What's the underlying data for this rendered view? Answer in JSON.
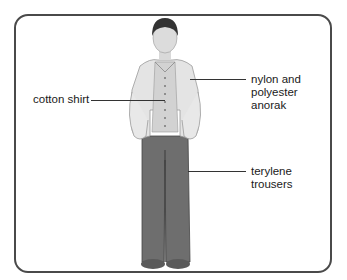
{
  "diagram": {
    "title": "",
    "labels": {
      "shirt": "cotton shirt",
      "anorak_line1": "nylon and",
      "anorak_line2": "polyester",
      "anorak_line3": "anorak",
      "trousers_line1": "terylene",
      "trousers_line2": "trousers"
    },
    "colors": {
      "frame": "#4a4a4a",
      "anorak": "#e2e2e2",
      "shirt": "#cfcfcf",
      "trousers": "#6e6e6e",
      "hair": "#333333",
      "skin": "#d9d9d9"
    }
  }
}
